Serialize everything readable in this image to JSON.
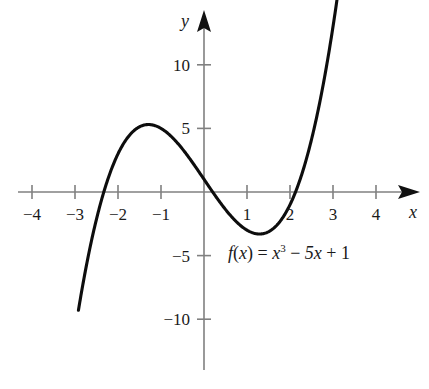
{
  "chart_data": {
    "type": "line",
    "title": "",
    "subtitle": "",
    "xlabel": "x",
    "ylabel": "y",
    "xlim": [
      -4.6,
      4.8
    ],
    "ylim": [
      -12.0,
      11.6
    ],
    "grid": false,
    "legend": null,
    "function_expression": "f(x) = x^3 - 5x + 1",
    "annotations": [
      {
        "name": "function-equation",
        "parts": {
          "fname": "f",
          "open_paren": "(",
          "arg": "x",
          "close_paren": ")",
          "equals": "=",
          "term1_base": "x",
          "term1_exp": "3",
          "minus": "−",
          "term2": "5x",
          "plus": "+",
          "term3": "1"
        },
        "x": 1.3,
        "y": -5.0
      }
    ],
    "x_ticks": [
      {
        "value": -4,
        "label": "−4"
      },
      {
        "value": -3,
        "label": "−3"
      },
      {
        "value": -2,
        "label": "−2"
      },
      {
        "value": -1,
        "label": "−1"
      },
      {
        "value": 1,
        "label": "1"
      },
      {
        "value": 2,
        "label": "2"
      },
      {
        "value": 3,
        "label": "3"
      },
      {
        "value": 4,
        "label": "4"
      }
    ],
    "y_ticks": [
      {
        "value": 10,
        "label": "10"
      },
      {
        "value": 5,
        "label": "5"
      },
      {
        "value": -5,
        "label": "−5"
      },
      {
        "value": -10,
        "label": "−10"
      }
    ],
    "series": [
      {
        "name": "f(x) = x^3 - 5x + 1",
        "color": "#0d0d0d",
        "width": 3.1,
        "domain": [
          -2.92,
          3.12
        ],
        "points": [
          [
            -2.92,
            -9.29
          ],
          [
            -2.85,
            -8.9
          ],
          [
            -2.8,
            -8.96
          ],
          [
            -2.7,
            -7.18
          ],
          [
            -2.6,
            -5.58
          ],
          [
            -2.5,
            -4.13
          ],
          [
            -2.4,
            -2.82
          ],
          [
            -2.33,
            -1.99
          ],
          [
            -2.2,
            -0.65
          ],
          [
            -2.1,
            0.24
          ],
          [
            -2.0,
            1.0
          ],
          [
            -1.9,
            1.64
          ],
          [
            -1.8,
            2.17
          ],
          [
            -1.7,
            2.59
          ],
          [
            -1.6,
            2.9
          ],
          [
            -1.5,
            3.13
          ],
          [
            -1.4,
            3.26
          ],
          [
            -1.3,
            3.3
          ],
          [
            -1.291,
            3.3033
          ],
          [
            -1.2,
            3.27
          ],
          [
            -1.1,
            3.17
          ],
          [
            -1.0,
            3.0
          ],
          [
            -0.9,
            2.77
          ],
          [
            -0.8,
            2.49
          ],
          [
            -0.7,
            2.16
          ],
          [
            -0.6,
            1.78
          ],
          [
            -0.5,
            1.38
          ],
          [
            -0.4,
            0.94
          ],
          [
            -0.3,
            0.47
          ],
          [
            -0.2,
            -0.01
          ],
          [
            -0.1,
            -0.5
          ],
          [
            0.0,
            1.0
          ],
          [
            0.1,
            0.5
          ],
          [
            0.2,
            0.01
          ],
          [
            0.3,
            -0.47
          ],
          [
            0.4,
            -0.94
          ],
          [
            0.5,
            -1.38
          ],
          [
            0.6,
            -1.78
          ],
          [
            0.7,
            -2.16
          ],
          [
            0.8,
            -2.49
          ],
          [
            0.9,
            -2.77
          ],
          [
            1.0,
            -3.0
          ],
          [
            1.1,
            -3.17
          ],
          [
            1.2,
            -3.27
          ],
          [
            1.291,
            -3.3033
          ],
          [
            1.3,
            -3.3
          ],
          [
            1.4,
            -3.26
          ],
          [
            1.5,
            -3.13
          ],
          [
            1.6,
            -2.9
          ],
          [
            1.7,
            -2.59
          ],
          [
            1.8,
            -2.17
          ],
          [
            1.9,
            -1.64
          ],
          [
            2.0,
            -1.0
          ],
          [
            2.1,
            -0.24
          ],
          [
            2.1284,
            0.0
          ],
          [
            2.2,
            0.65
          ],
          [
            2.3,
            1.67
          ],
          [
            2.4,
            2.82
          ],
          [
            2.5,
            4.13
          ],
          [
            2.6,
            5.58
          ],
          [
            2.7,
            7.18
          ],
          [
            2.8,
            8.96
          ],
          [
            2.9,
            10.89
          ],
          [
            3.0,
            13.0
          ],
          [
            3.12,
            15.78
          ]
        ]
      }
    ],
    "axes": {
      "color": "#808080",
      "arrow_color": "#111111",
      "x_axis_label": "x",
      "y_axis_label": "y"
    }
  }
}
